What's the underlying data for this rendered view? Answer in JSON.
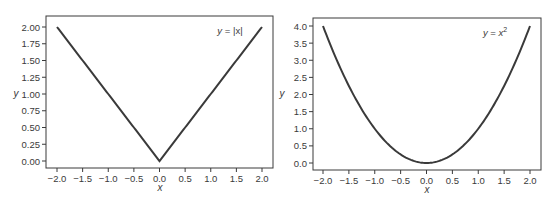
{
  "chart_data": [
    {
      "type": "line",
      "title": "",
      "annotation": "y = |x|",
      "annotation_parts": {
        "lhs": "y",
        "eq": " = ",
        "rhs": "|x|"
      },
      "xlabel": "x",
      "ylabel": "y",
      "xlim": [
        -2.15,
        2.15
      ],
      "ylim": [
        -0.1,
        2.15
      ],
      "xticks": [
        -2.0,
        -1.5,
        -1.0,
        -0.5,
        0.0,
        0.5,
        1.0,
        1.5,
        2.0
      ],
      "xtick_labels": [
        "−2.0",
        "−1.5",
        "−1.0",
        "−0.5",
        "0.0",
        "0.5",
        "1.0",
        "1.5",
        "2.0"
      ],
      "yticks": [
        0.0,
        0.25,
        0.5,
        0.75,
        1.0,
        1.25,
        1.5,
        1.75,
        2.0
      ],
      "ytick_labels": [
        "0.00",
        "0.25",
        "0.50",
        "0.75",
        "1.00",
        "1.25",
        "1.50",
        "1.75",
        "2.00"
      ],
      "grid": false,
      "series": [
        {
          "name": "y = |x|",
          "x": [
            -2.0,
            -1.5,
            -1.0,
            -0.5,
            0.0,
            0.5,
            1.0,
            1.5,
            2.0
          ],
          "y": [
            2.0,
            1.5,
            1.0,
            0.5,
            0.0,
            0.5,
            1.0,
            1.5,
            2.0
          ],
          "color": "#3a3a3a"
        }
      ]
    },
    {
      "type": "line",
      "title": "",
      "annotation": "y = x²",
      "annotation_parts": {
        "lhs": "y",
        "eq": " = ",
        "rhs": "x",
        "sup": "2"
      },
      "xlabel": "x",
      "ylabel": "y",
      "xlim": [
        -2.15,
        2.15
      ],
      "ylim": [
        -0.2,
        4.2
      ],
      "xticks": [
        -2.0,
        -1.5,
        -1.0,
        -0.5,
        0.0,
        0.5,
        1.0,
        1.5,
        2.0
      ],
      "xtick_labels": [
        "−2.0",
        "−1.5",
        "−1.0",
        "−0.5",
        "0.0",
        "0.5",
        "1.0",
        "1.5",
        "2.0"
      ],
      "yticks": [
        0.0,
        0.5,
        1.0,
        1.5,
        2.0,
        2.5,
        3.0,
        3.5,
        4.0
      ],
      "ytick_labels": [
        "0.0",
        "0.5",
        "1.0",
        "1.5",
        "2.0",
        "2.5",
        "3.0",
        "3.5",
        "4.0"
      ],
      "grid": false,
      "series": [
        {
          "name": "y = x²",
          "x": [
            -2.0,
            -1.5,
            -1.0,
            -0.5,
            0.0,
            0.5,
            1.0,
            1.5,
            2.0
          ],
          "y": [
            4.0,
            2.25,
            1.0,
            0.25,
            0.0,
            0.25,
            1.0,
            2.25,
            4.0
          ],
          "color": "#3a3a3a"
        }
      ]
    }
  ],
  "colors": {
    "line": "#3a3a3a",
    "axes": "#3a3a3a",
    "text": "#3a3a3a",
    "background": "#ffffff"
  }
}
